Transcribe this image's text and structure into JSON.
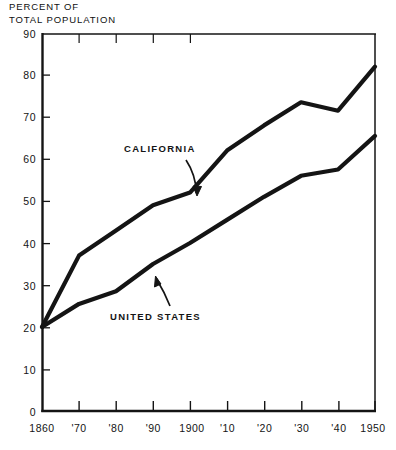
{
  "chart_data": {
    "type": "line",
    "title_line1": "PERCENT OF",
    "title_line2": "TOTAL POPULATION",
    "xlabel": "",
    "ylabel": "",
    "grid": false,
    "legend": "inline-annotations",
    "xlim": [
      1860,
      1950
    ],
    "ylim": [
      0,
      90
    ],
    "x": [
      1860,
      1870,
      1880,
      1890,
      1900,
      1910,
      1920,
      1930,
      1940,
      1950
    ],
    "xtick_labels": [
      "1860",
      "'70",
      "'80",
      "'90",
      "1900",
      "'10",
      "'20",
      "'30",
      "'40",
      "1950"
    ],
    "ytick_labels": [
      "0",
      "10",
      "20",
      "30",
      "40",
      "50",
      "60",
      "70",
      "80",
      "90"
    ],
    "ytick_values": [
      0,
      10,
      20,
      30,
      40,
      50,
      60,
      70,
      80,
      90
    ],
    "series": [
      {
        "name": "CALIFORNIA",
        "values": [
          20,
          37,
          43,
          49,
          52,
          62,
          68,
          73.5,
          71.5,
          82
        ],
        "color": "#141414"
      },
      {
        "name": "UNITED STATES",
        "values": [
          20,
          25.5,
          28.5,
          35,
          40,
          45.5,
          51,
          56,
          57.5,
          65.5
        ],
        "color": "#141414"
      }
    ],
    "annotations": [
      {
        "text": "CALIFORNIA",
        "x_px": 124,
        "y_px": 148,
        "arrow": "curved-down-right"
      },
      {
        "text": "UNITED STATES",
        "x_px": 110,
        "y_px": 316,
        "arrow": "curved-up-left"
      }
    ]
  }
}
